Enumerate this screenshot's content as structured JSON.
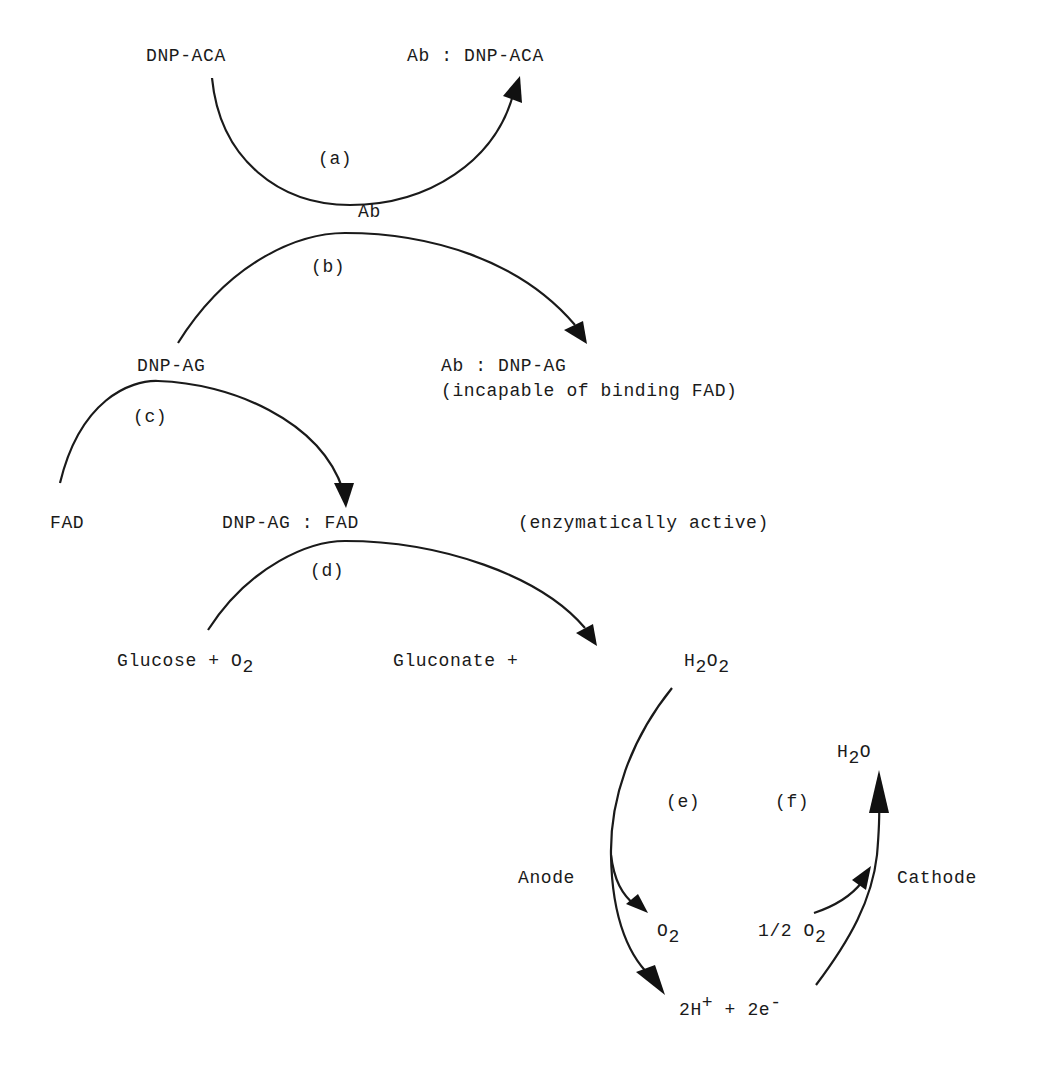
{
  "diagram": {
    "type": "reaction-scheme",
    "style": {
      "ink_color": "#1a1a1a",
      "background": "#ffffff"
    },
    "species": {
      "dnp_aca": "DNP-ACA",
      "ab_dnp_aca": "Ab : DNP-ACA",
      "ab": "Ab",
      "dnp_ag": "DNP-AG",
      "ab_dnp_ag": "Ab : DNP-AG",
      "ab_dnp_ag_note": "(incapable of binding FAD)",
      "fad": "FAD",
      "dnp_ag_fad": "DNP-AG : FAD",
      "dnp_ag_fad_note": "(enzymatically active)",
      "glucose_o2": {
        "text": "Glucose + O",
        "sub": "2"
      },
      "gluconate": "Gluconate + ",
      "h2o2": {
        "h": "H",
        "sub1": "2",
        "o": "O",
        "sub2": "2"
      },
      "h2o": {
        "h": "H",
        "sub": "2",
        "o": "O"
      },
      "anode": "Anode",
      "cathode": "Cathode",
      "o2": {
        "o": "O",
        "sub": "2"
      },
      "half_o2": {
        "text": "1/2 O",
        "sub": "2"
      },
      "protons_electrons": {
        "h": "2H",
        "sup1": "+",
        "mid": " + 2e",
        "sup2": "-"
      }
    },
    "steps": [
      {
        "id": "a",
        "label": "(a)",
        "from": "DNP-ACA + Ab",
        "to": "Ab : DNP-ACA"
      },
      {
        "id": "b",
        "label": "(b)",
        "from": "DNP-AG + Ab",
        "to": "Ab : DNP-AG"
      },
      {
        "id": "c",
        "label": "(c)",
        "from": "FAD + DNP-AG",
        "to": "DNP-AG : FAD"
      },
      {
        "id": "d",
        "label": "(d)",
        "from": "Glucose + O2",
        "to": "Gluconate + H2O2"
      },
      {
        "id": "e",
        "label": "(e)",
        "from": "H2O2",
        "to": "O2 + 2H+ + 2e-",
        "electrode": "Anode"
      },
      {
        "id": "f",
        "label": "(f)",
        "from": "1/2 O2 + 2H+ + 2e-",
        "to": "H2O",
        "electrode": "Cathode"
      }
    ]
  }
}
